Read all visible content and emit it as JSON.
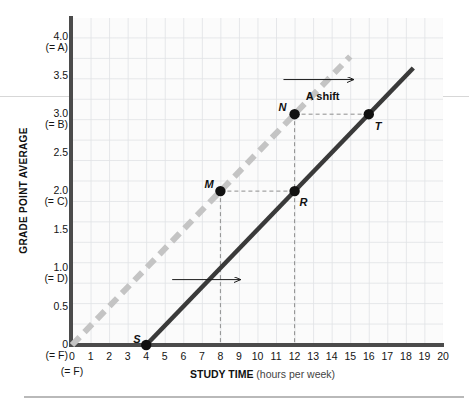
{
  "chart_data": {
    "type": "line",
    "title": "",
    "xlabel_bold": "STUDY TIME",
    "xlabel_paren": "(hours per week)",
    "ylabel": "GRADE POINT AVERAGE",
    "xlim": [
      0,
      20
    ],
    "ylim": [
      0,
      4.25
    ],
    "grid": true,
    "legend": "none",
    "x_ticks": [
      "0",
      "1",
      "2",
      "3",
      "4",
      "5",
      "6",
      "7",
      "8",
      "9",
      "10",
      "11",
      "12",
      "13",
      "14",
      "15",
      "16",
      "17",
      "18",
      "19",
      "20"
    ],
    "x_tick_sub": {
      "0": "(= F)"
    },
    "y_ticks": [
      {
        "value": 0,
        "label": "0",
        "sub": "(= F)"
      },
      {
        "value": 0.5,
        "label": "0.5",
        "sub": ""
      },
      {
        "value": 1.0,
        "label": "1.0",
        "sub": "(= D)"
      },
      {
        "value": 1.5,
        "label": "1.5",
        "sub": ""
      },
      {
        "value": 2.0,
        "label": "2.0",
        "sub": "(= C)"
      },
      {
        "value": 2.5,
        "label": "2.5",
        "sub": ""
      },
      {
        "value": 3.0,
        "label": "3.0",
        "sub": "(= B)"
      },
      {
        "value": 3.5,
        "label": "3.5",
        "sub": ""
      },
      {
        "value": 4.0,
        "label": "4.0",
        "sub": "(= A)"
      }
    ],
    "series": [
      {
        "name": "original-line",
        "style": "dashed",
        "color": "#c4c4c4",
        "points": [
          {
            "x": 0,
            "y": 0
          },
          {
            "x": 15.0,
            "y": 3.75
          }
        ]
      },
      {
        "name": "shifted-line",
        "style": "solid",
        "color": "#3a3a3a",
        "points": [
          {
            "x": 4,
            "y": 0
          },
          {
            "x": 18.4,
            "y": 3.6
          }
        ]
      }
    ],
    "annotations": [
      {
        "name": "point-S",
        "label": "S",
        "x": 4,
        "y": 0.0,
        "label_dx": -13,
        "label_dy": -6
      },
      {
        "name": "point-M",
        "label": "M",
        "x": 8,
        "y": 2.0,
        "label_dx": -16,
        "label_dy": -7
      },
      {
        "name": "point-R",
        "label": "R",
        "x": 12,
        "y": 2.0,
        "label_dx": 5,
        "label_dy": 11
      },
      {
        "name": "point-N",
        "label": "N",
        "x": 12,
        "y": 3.0,
        "label_dx": -16,
        "label_dy": -7
      },
      {
        "name": "point-T",
        "label": "T",
        "x": 16,
        "y": 3.0,
        "label_dx": 6,
        "label_dy": 12
      }
    ],
    "shift_label": "A shift",
    "shift_label_x": 12.6,
    "shift_label_y": 3.22,
    "arrows": [
      {
        "name": "shift-arrow-upper",
        "x1": 11.4,
        "y1": 3.45,
        "x2": 15.2,
        "y2": 3.45
      },
      {
        "name": "shift-arrow-lower",
        "x1": 5.4,
        "y1": 0.85,
        "x2": 9.1,
        "y2": 0.85
      }
    ],
    "guide_lines": [
      {
        "name": "guide-M-to-R",
        "x1": 8,
        "y1": 2.0,
        "x2": 12,
        "y2": 2.0
      },
      {
        "name": "guide-N-to-T",
        "x1": 12,
        "y1": 3.0,
        "x2": 16,
        "y2": 3.0
      },
      {
        "name": "guide-M-drop",
        "x1": 8,
        "y1": 2.0,
        "x2": 8,
        "y2": 0.0
      },
      {
        "name": "guide-N-drop",
        "x1": 12,
        "y1": 3.0,
        "x2": 12,
        "y2": 0.0
      }
    ]
  },
  "colors": {
    "axis": "#4b4b4b",
    "original_line": "#c4c4c4",
    "shifted_line": "#3a3a3a",
    "grid": "#e1e3e6",
    "plot_bg": "#fbfbfb",
    "guide": "#8e8e8e"
  }
}
